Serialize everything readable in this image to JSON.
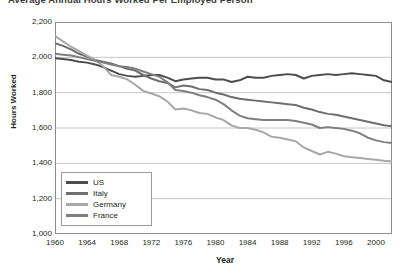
{
  "chart_data": {
    "type": "line",
    "title": "Average Annual Hours Worked Per Employed Person",
    "xlabel": "Year",
    "ylabel": "Hours Worked",
    "xlim": [
      1960,
      2002
    ],
    "ylim": [
      1000,
      2200
    ],
    "ytick_step": 200,
    "xtick_step": 4,
    "grid": true,
    "legend_position": "inside-lower-left",
    "ytick_labels": [
      "1,000",
      "1,200",
      "1,400",
      "1,600",
      "1,800",
      "2,000",
      "2,200"
    ],
    "ytick_values": [
      1000,
      1200,
      1400,
      1600,
      1800,
      2000,
      2200
    ],
    "xtick_labels": [
      "1960",
      "1964",
      "1968",
      "1972",
      "1976",
      "1980",
      "1984",
      "1988",
      "1992",
      "1996",
      "2000"
    ],
    "xtick_values": [
      1960,
      1964,
      1968,
      1972,
      1976,
      1980,
      1984,
      1988,
      1992,
      1996,
      2000
    ],
    "x": [
      1960,
      1961,
      1962,
      1963,
      1964,
      1965,
      1966,
      1967,
      1968,
      1969,
      1970,
      1971,
      1972,
      1973,
      1974,
      1975,
      1976,
      1977,
      1978,
      1979,
      1980,
      1981,
      1982,
      1983,
      1984,
      1985,
      1986,
      1987,
      1988,
      1989,
      1990,
      1991,
      1992,
      1993,
      1994,
      1995,
      1996,
      1997,
      1998,
      1999,
      2000,
      2001,
      2002
    ],
    "series": [
      {
        "name": "US",
        "color": "#4d4d4d",
        "values": [
          1995,
          1990,
          1985,
          1975,
          1970,
          1960,
          1945,
          1925,
          1905,
          1895,
          1890,
          1895,
          1900,
          1900,
          1885,
          1865,
          1875,
          1880,
          1885,
          1885,
          1875,
          1875,
          1860,
          1870,
          1890,
          1885,
          1885,
          1895,
          1900,
          1905,
          1900,
          1880,
          1895,
          1900,
          1905,
          1900,
          1905,
          1910,
          1905,
          1900,
          1895,
          1870,
          1860
        ],
        "end_value": 1860
      },
      {
        "name": "Italy",
        "color": "#6e6e6e",
        "values": [
          2080,
          2065,
          2045,
          2020,
          2005,
          1985,
          1975,
          1965,
          1950,
          1935,
          1925,
          1900,
          1880,
          1865,
          1855,
          1830,
          1840,
          1835,
          1820,
          1815,
          1800,
          1790,
          1775,
          1765,
          1760,
          1755,
          1750,
          1745,
          1740,
          1735,
          1730,
          1715,
          1705,
          1690,
          1680,
          1675,
          1665,
          1655,
          1645,
          1635,
          1625,
          1615,
          1610
        ],
        "end_value": 1610
      },
      {
        "name": "Germany",
        "color": "#a8a8a8",
        "values": [
          2120,
          2090,
          2060,
          2035,
          2010,
          1985,
          1950,
          1900,
          1890,
          1875,
          1845,
          1810,
          1795,
          1780,
          1750,
          1705,
          1710,
          1700,
          1685,
          1680,
          1660,
          1645,
          1615,
          1600,
          1600,
          1590,
          1575,
          1550,
          1545,
          1535,
          1525,
          1490,
          1470,
          1450,
          1465,
          1455,
          1440,
          1435,
          1430,
          1425,
          1420,
          1415,
          1410
        ],
        "end_value": 1410
      },
      {
        "name": "France",
        "color": "#7f7f7f",
        "values": [
          2020,
          2015,
          2010,
          2000,
          1990,
          1980,
          1970,
          1960,
          1950,
          1945,
          1935,
          1920,
          1905,
          1890,
          1860,
          1815,
          1810,
          1800,
          1785,
          1775,
          1760,
          1735,
          1700,
          1670,
          1655,
          1650,
          1645,
          1645,
          1645,
          1645,
          1640,
          1630,
          1620,
          1600,
          1605,
          1600,
          1595,
          1585,
          1570,
          1545,
          1530,
          1520,
          1515
        ],
        "end_value": 1515
      }
    ]
  }
}
